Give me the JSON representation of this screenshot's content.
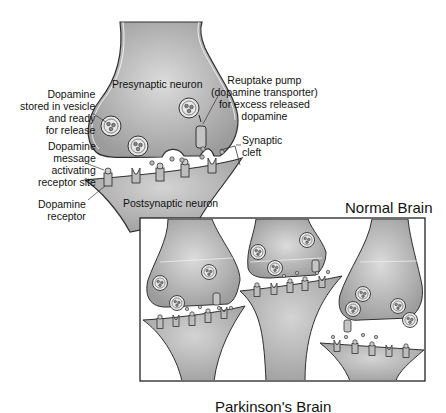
{
  "diagram": {
    "type": "synapse-comparison",
    "labels": {
      "presynaptic": "Presynaptic neuron",
      "postsynaptic": "Postsynaptic neuron",
      "vesicle": "Dopamine\nstored in vesicle\nand ready\nfor release",
      "message": "Dopamine\nmessage\nactivating\nreceptor site",
      "receptor": "Dopamine\nreceptor",
      "reuptake": "Reuptake pump\n(dopamine transporter)\nfor excess released\ndopamine",
      "cleft": "Synaptic\ncleft"
    },
    "titles": {
      "normal": "Normal Brain",
      "parkinsons": "Parkinson's Brain"
    },
    "colors": {
      "neuron_fill": "#a9a9a9",
      "neuron_highlight": "#d6d6d6",
      "outline": "#3a3a3a",
      "background": "#ffffff"
    }
  }
}
